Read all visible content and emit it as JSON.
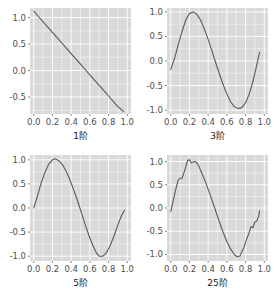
{
  "figure": {
    "title": "",
    "background": "#ffffff",
    "panel_background": "#d9d9d9",
    "grid_color": "#ffffff",
    "line_color": "#535353",
    "layout": "2x2 grid of line plots"
  },
  "chart_data": [
    {
      "type": "line",
      "title": "",
      "xlabel": "1阶",
      "ylabel": "",
      "xlim": [
        -0.04,
        1.04
      ],
      "ylim": [
        -0.82,
        1.18
      ],
      "xticks": [
        0.0,
        0.2,
        0.4,
        0.6,
        0.8,
        1.0
      ],
      "xtick_labels": [
        "0.0",
        "0.2",
        "0.4",
        "0.6",
        "0.8",
        "1.0"
      ],
      "yticks": [
        -0.5,
        0.0,
        0.5,
        1.0
      ],
      "ytick_labels": [
        "-0.5",
        "0.0",
        "0.5",
        "1.0"
      ],
      "grid": true,
      "legend": "none",
      "series": [
        {
          "name": "1st order Fourier approximation",
          "x": [
            0.0,
            0.05,
            0.1,
            0.15,
            0.2,
            0.25,
            0.3,
            0.35,
            0.4,
            0.45,
            0.5,
            0.55,
            0.6,
            0.65,
            0.7,
            0.75,
            0.8,
            0.85,
            0.9,
            0.96
          ],
          "values": [
            1.12,
            1.02,
            0.92,
            0.82,
            0.72,
            0.62,
            0.52,
            0.42,
            0.32,
            0.22,
            0.12,
            0.02,
            -0.08,
            -0.18,
            -0.28,
            -0.38,
            -0.48,
            -0.58,
            -0.68,
            -0.77
          ]
        }
      ]
    },
    {
      "type": "line",
      "title": "",
      "xlabel": "3阶",
      "ylabel": "",
      "xlim": [
        -0.04,
        1.04
      ],
      "ylim": [
        -1.08,
        1.08
      ],
      "xticks": [
        0.0,
        0.2,
        0.4,
        0.6,
        0.8,
        1.0
      ],
      "xtick_labels": [
        "0.0",
        "0.2",
        "0.4",
        "0.6",
        "0.8",
        "1.0"
      ],
      "yticks": [
        -1.0,
        -0.5,
        0.0,
        0.5,
        1.0
      ],
      "ytick_labels": [
        "-1.0",
        "-0.5",
        "0.0",
        "0.5",
        "1.0"
      ],
      "grid": true,
      "legend": "none",
      "series": [
        {
          "name": "3rd order Fourier approximation",
          "x": [
            0.0,
            0.04,
            0.08,
            0.12,
            0.16,
            0.2,
            0.24,
            0.28,
            0.32,
            0.36,
            0.4,
            0.44,
            0.48,
            0.52,
            0.56,
            0.6,
            0.64,
            0.68,
            0.72,
            0.76,
            0.8,
            0.84,
            0.88,
            0.92,
            0.95
          ],
          "values": [
            -0.17,
            0.05,
            0.33,
            0.6,
            0.83,
            0.97,
            1.0,
            0.95,
            0.83,
            0.65,
            0.44,
            0.21,
            -0.03,
            -0.26,
            -0.48,
            -0.67,
            -0.83,
            -0.93,
            -0.97,
            -0.95,
            -0.85,
            -0.67,
            -0.41,
            -0.08,
            0.18
          ]
        }
      ]
    },
    {
      "type": "line",
      "title": "",
      "xlabel": "5阶",
      "ylabel": "",
      "xlim": [
        -0.04,
        1.04
      ],
      "ylim": [
        -1.1,
        1.1
      ],
      "xticks": [
        0.0,
        0.2,
        0.4,
        0.6,
        0.8,
        1.0
      ],
      "xtick_labels": [
        "0.0",
        "0.2",
        "0.4",
        "0.6",
        "0.8",
        "1.0"
      ],
      "yticks": [
        -1.0,
        -0.5,
        0.0,
        0.5,
        1.0
      ],
      "ytick_labels": [
        "-1.0",
        "-0.5",
        "0.0",
        "0.5",
        "1.0"
      ],
      "grid": true,
      "legend": "none",
      "series": [
        {
          "name": "5th order Fourier approximation",
          "x": [
            0.0,
            0.04,
            0.08,
            0.12,
            0.16,
            0.2,
            0.23,
            0.27,
            0.31,
            0.35,
            0.39,
            0.43,
            0.47,
            0.51,
            0.55,
            0.59,
            0.63,
            0.67,
            0.7,
            0.74,
            0.78,
            0.82,
            0.86,
            0.9,
            0.94,
            0.97
          ],
          "values": [
            0.0,
            0.25,
            0.52,
            0.74,
            0.91,
            1.0,
            1.02,
            0.98,
            0.89,
            0.75,
            0.57,
            0.36,
            0.14,
            -0.1,
            -0.34,
            -0.57,
            -0.77,
            -0.93,
            -1.0,
            -1.0,
            -0.92,
            -0.77,
            -0.57,
            -0.35,
            -0.15,
            -0.05
          ]
        }
      ]
    },
    {
      "type": "line",
      "title": "",
      "xlabel": "25阶",
      "ylabel": "",
      "xlim": [
        -0.04,
        1.04
      ],
      "ylim": [
        -1.14,
        1.14
      ],
      "xticks": [
        0.0,
        0.2,
        0.4,
        0.6,
        0.8,
        1.0
      ],
      "xtick_labels": [
        "0.0",
        "0.2",
        "0.4",
        "0.6",
        "0.8",
        "1.0"
      ],
      "yticks": [
        -1.0,
        -0.5,
        0.0,
        0.5,
        1.0
      ],
      "ytick_labels": [
        "-1.0",
        "-0.5",
        "0.0",
        "0.5",
        "1.0"
      ],
      "grid": true,
      "legend": "none",
      "series": [
        {
          "name": "25th order Fourier approximation",
          "x": [
            0.0,
            0.02,
            0.04,
            0.06,
            0.08,
            0.1,
            0.12,
            0.14,
            0.16,
            0.18,
            0.2,
            0.22,
            0.24,
            0.26,
            0.28,
            0.3,
            0.33,
            0.36,
            0.4,
            0.44,
            0.48,
            0.52,
            0.56,
            0.6,
            0.64,
            0.68,
            0.71,
            0.74,
            0.78,
            0.81,
            0.84,
            0.86,
            0.88,
            0.9,
            0.92,
            0.94,
            0.95
          ],
          "values": [
            -0.08,
            0.1,
            0.28,
            0.45,
            0.6,
            0.64,
            0.64,
            0.75,
            0.88,
            1.02,
            1.04,
            0.97,
            0.99,
            1.0,
            0.97,
            0.9,
            0.76,
            0.62,
            0.4,
            0.18,
            -0.06,
            -0.3,
            -0.52,
            -0.72,
            -0.88,
            -1.0,
            -1.05,
            -1.03,
            -0.86,
            -0.68,
            -0.52,
            -0.4,
            -0.42,
            -0.3,
            -0.28,
            -0.18,
            -0.06
          ]
        }
      ]
    }
  ]
}
